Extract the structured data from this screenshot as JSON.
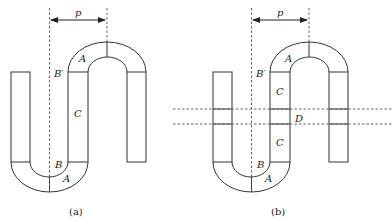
{
  "figures": [
    {
      "id": "a",
      "caption": "(a)",
      "labels": {
        "p": "p",
        "A_top": "A",
        "B_prime": "B′",
        "C": "C",
        "B": "B",
        "A_bottom": "A"
      }
    },
    {
      "id": "b",
      "caption": "(b)",
      "labels": {
        "p": "p",
        "A_top": "A",
        "B_prime": "B′",
        "C_upper": "C",
        "D": "D",
        "C_lower": "C",
        "B": "B",
        "A_bottom": "A"
      }
    }
  ]
}
